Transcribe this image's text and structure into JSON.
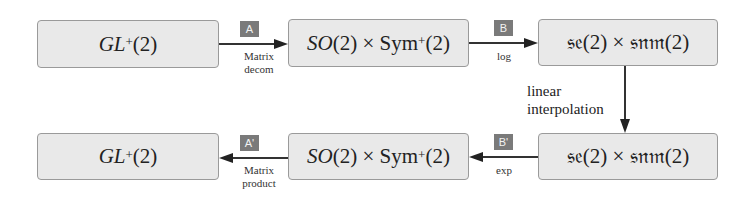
{
  "top_row": {
    "box1": {
      "main": "GL",
      "sup": "+",
      "suffix": "(2)"
    },
    "box2": {
      "a": "SO",
      "b": "(2) × Sym",
      "sup": "+",
      "suffix": "(2)"
    },
    "box3": {
      "text": "𝔰𝔢(2) × 𝔰𝔫𝔪(2)"
    }
  },
  "bottom_row": {
    "box4": {
      "text": "𝔰𝔢(2) × 𝔰𝔫𝔪(2)"
    },
    "box5": {
      "a": "SO",
      "b": "(2) × Sym",
      "sup": "+",
      "suffix": "(2)"
    },
    "box6": {
      "main": "GL",
      "sup": "+",
      "suffix": "(2)"
    }
  },
  "edges": {
    "A": {
      "tag": "A",
      "line1": "Matrix",
      "line2": "decom"
    },
    "B": {
      "tag": "B",
      "line1": "log"
    },
    "vertical": {
      "line1": "linear",
      "line2": "interpolation"
    },
    "B_prime": {
      "tag": "B'",
      "line1": "exp"
    },
    "A_prime": {
      "tag": "A'",
      "line1": "Matrix",
      "line2": "product"
    }
  }
}
